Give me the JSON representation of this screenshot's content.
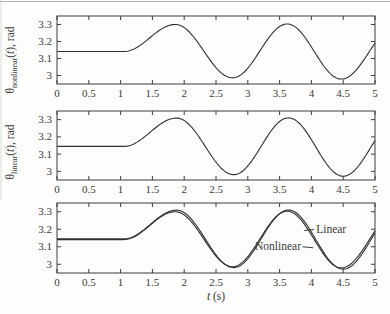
{
  "figure": {
    "background": "#fdfdfc",
    "ink": "#3a3a3a",
    "axis_color": "#3d3d3d",
    "curve_color": "#2f2f2f",
    "scan_artifact_color": "#b5b5b5"
  },
  "chart_data": [
    {
      "type": "line",
      "ylabel": {
        "symbol": "θ",
        "sub": "nonlinear",
        "open": "(",
        "var": "t",
        "close": "), rad"
      },
      "xlim": [
        0,
        5
      ],
      "ylim": [
        2.95,
        3.35
      ],
      "xticks": [
        0,
        0.5,
        1,
        1.5,
        2,
        2.5,
        3,
        3.5,
        4,
        4.5,
        5
      ],
      "yticks": [
        3,
        3.1,
        3.2,
        3.3
      ],
      "grid": false,
      "series": [
        {
          "name": "Nonlinear",
          "keypoints": [
            [
              0,
              3.141
            ],
            [
              1.05,
              3.141
            ],
            [
              1.86,
              3.3
            ],
            [
              2.76,
              2.986
            ],
            [
              3.62,
              3.303
            ],
            [
              4.47,
              2.979
            ],
            [
              5.35,
              3.301
            ]
          ]
        }
      ]
    },
    {
      "type": "line",
      "ylabel": {
        "symbol": "θ",
        "sub": "linear",
        "open": "(",
        "var": "t",
        "close": "), rad"
      },
      "xlim": [
        0,
        5
      ],
      "ylim": [
        2.95,
        3.35
      ],
      "xticks": [
        0,
        0.5,
        1,
        1.5,
        2,
        2.5,
        3,
        3.5,
        4,
        4.5,
        5
      ],
      "yticks": [
        3,
        3.1,
        3.2,
        3.3
      ],
      "grid": false,
      "series": [
        {
          "name": "Linear",
          "keypoints": [
            [
              0,
              3.145
            ],
            [
              1.05,
              3.145
            ],
            [
              1.88,
              3.309
            ],
            [
              2.78,
              2.981
            ],
            [
              3.64,
              3.31
            ],
            [
              4.5,
              2.972
            ],
            [
              5.37,
              3.308
            ]
          ]
        }
      ]
    },
    {
      "type": "line",
      "xlabel": {
        "var": "t",
        "rest": " (s)"
      },
      "xlim": [
        0,
        5
      ],
      "ylim": [
        2.95,
        3.35
      ],
      "xticks": [
        0,
        0.5,
        1,
        1.5,
        2,
        2.5,
        3,
        3.5,
        4,
        4.5,
        5
      ],
      "yticks": [
        3,
        3.1,
        3.2,
        3.3
      ],
      "grid": false,
      "series": [
        {
          "name": "Nonlinear",
          "keypoints": [
            [
              0,
              3.141
            ],
            [
              1.05,
              3.141
            ],
            [
              1.86,
              3.3
            ],
            [
              2.76,
              2.986
            ],
            [
              3.62,
              3.303
            ],
            [
              4.47,
              2.979
            ],
            [
              5.35,
              3.301
            ]
          ]
        },
        {
          "name": "Linear",
          "keypoints": [
            [
              0,
              3.145
            ],
            [
              1.05,
              3.145
            ],
            [
              1.88,
              3.309
            ],
            [
              2.78,
              2.981
            ],
            [
              3.64,
              3.31
            ],
            [
              4.5,
              2.972
            ],
            [
              5.37,
              3.308
            ]
          ]
        }
      ],
      "annotations": [
        {
          "label": "Linear",
          "anchor": "start",
          "x": 4.075,
          "y": 3.2,
          "leader": {
            "x1": 3.89,
            "y1": 3.193,
            "x2": 4.04,
            "y2": 3.198
          }
        },
        {
          "label": "Nonlinear",
          "anchor": "end",
          "x": 3.836,
          "y": 3.103,
          "leader": {
            "x1": 3.86,
            "y1": 3.1,
            "x2": 4.03,
            "y2": 3.094
          }
        }
      ]
    }
  ]
}
